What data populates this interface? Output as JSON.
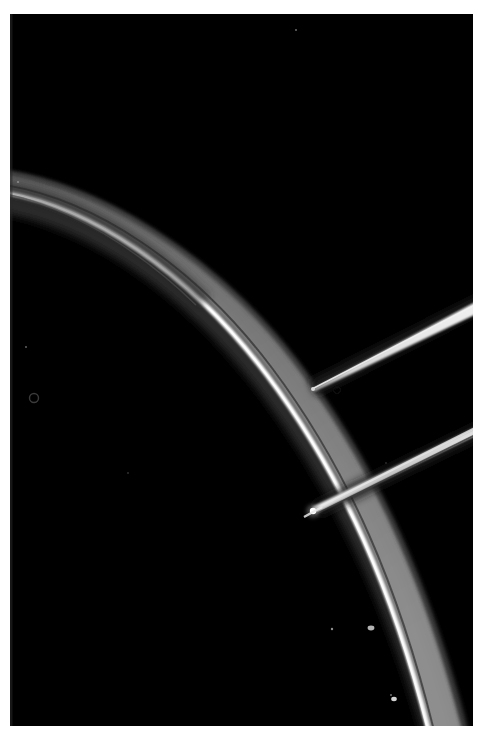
{
  "image": {
    "kind": "scientific-micrograph",
    "caption_visible": false,
    "width_px": 485,
    "height_px": 739,
    "background_color": "#000000",
    "border_color": "#ffffff",
    "border": {
      "left_px": 10,
      "top_px": 14,
      "right_px": 12,
      "bottom_px": 13
    }
  },
  "colors": {
    "background": "#000000",
    "frame": "#ffffff",
    "core_bright": "#f6f6f6",
    "band_grey": "#8d8d8d",
    "band_grey_dark": "#5a5a5a",
    "halo": "#3a3a3a",
    "filament_bright": "#e8e8e8",
    "edge_line": "#2a2a2a",
    "speck": "#cfcfcf"
  },
  "features": [
    {
      "id": "curved-arc",
      "name": "curved-fiber-arc",
      "description": "Large bright curved filament sweeping from upper-left edge to lower-right, convex toward upper-right",
      "kind": "arc",
      "path": "M -8 186 C 90 196 192 268 268 368 C 344 468 396 588 432 739",
      "core_path": "M -8 190 C 88 200 188 272 264 372 C 340 472 392 592 428 739",
      "core_width_px": 4.5,
      "band_width_start_px": 9,
      "band_width_end_px": 34,
      "core_color": "#f3f3f3",
      "band_color": "#8d8d8d"
    },
    {
      "id": "needle-probe",
      "name": "needle-probe-tip",
      "description": "Tapered needle / micro-probe entering from right edge, tip pointing lower-left, terminating mid-frame",
      "kind": "tapered-line",
      "tip_x": 312,
      "tip_y": 388,
      "exit_x": 485,
      "exit_y": 303,
      "tip_width_px": 1.2,
      "base_width_px": 8,
      "color": "#e6e6e6"
    },
    {
      "id": "lower-filament",
      "name": "straight-filament",
      "description": "Straight filament running from the T-junction on the arc up toward the right edge",
      "kind": "line",
      "start_x": 314,
      "start_y": 510,
      "end_x": 485,
      "end_y": 427,
      "width_px": 7,
      "color": "#c9c9c9"
    },
    {
      "id": "junction-node",
      "name": "filament-arc-junction",
      "description": "Bright node where the straight filament contacts the curved arc",
      "kind": "node",
      "x": 313,
      "y": 511,
      "radius_px": 4,
      "color": "#ffffff"
    }
  ],
  "artifacts": [
    {
      "id": "ring-left",
      "name": "dust-ring-artifact",
      "x": 34,
      "y": 398,
      "r": 4.5,
      "kind": "ring",
      "color": "#2e2e2e"
    },
    {
      "id": "ring-tip",
      "name": "dust-ring-near-tip",
      "x": 337,
      "y": 390,
      "r": 3.5,
      "kind": "ring",
      "color": "#101010"
    },
    {
      "id": "speck-a",
      "name": "bright-speck",
      "x": 18,
      "y": 182,
      "r": 1.1,
      "kind": "speck",
      "color": "#8a8a8a"
    },
    {
      "id": "speck-b",
      "name": "bright-speck",
      "x": 26,
      "y": 347,
      "r": 0.9,
      "kind": "speck",
      "color": "#6a6a6a"
    },
    {
      "id": "speck-c",
      "name": "bright-speck",
      "x": 128,
      "y": 473,
      "r": 0.8,
      "kind": "speck",
      "color": "#5a5a5a"
    },
    {
      "id": "speck-d",
      "name": "bright-speck",
      "x": 332,
      "y": 629,
      "r": 1.2,
      "kind": "speck",
      "color": "#9a9a9a"
    },
    {
      "id": "speck-e",
      "name": "bright-speck",
      "x": 391,
      "y": 695,
      "r": 1.0,
      "kind": "speck",
      "color": "#7a7a7a"
    },
    {
      "id": "speck-f",
      "name": "bright-speck",
      "x": 296,
      "y": 30,
      "r": 1.0,
      "kind": "speck",
      "color": "#707070"
    },
    {
      "id": "speck-g",
      "name": "bright-speck",
      "x": 386,
      "y": 463,
      "r": 0.8,
      "kind": "speck",
      "color": "#4e4e4e"
    },
    {
      "id": "nodule-a",
      "name": "arc-surface-nodule",
      "x": 371,
      "y": 628,
      "r": 3.0,
      "kind": "speck",
      "color": "#b8b8b8"
    },
    {
      "id": "nodule-b",
      "name": "arc-surface-nodule",
      "x": 394,
      "y": 699,
      "r": 2.6,
      "kind": "speck",
      "color": "#d4d4d4"
    }
  ]
}
